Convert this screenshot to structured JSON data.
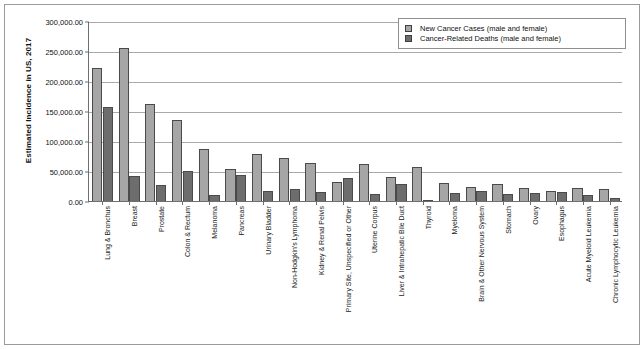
{
  "chart_data": {
    "type": "bar",
    "title": "",
    "xlabel": "",
    "ylabel": "Estimated Incidence in US, 2017",
    "ylim": [
      0,
      300000
    ],
    "ytick_labels": [
      "300,000.00",
      "250,000.00",
      "200,000.00",
      "150,000.00",
      "100,000.00",
      "50,000.00",
      "0.00"
    ],
    "ytick_values": [
      300000,
      250000,
      200000,
      150000,
      100000,
      50000,
      0
    ],
    "grid": true,
    "legend_position": "top-right",
    "categories": [
      "Lung & Bronchus",
      "Breast",
      "Prostate",
      "Colon & Rectum",
      "Melanoma",
      "Pancreas",
      "Urinary Bladder",
      "Non-Hodgkin's Lymphoma",
      "Kidney & Renal Pelvis",
      "Primary Site, Unspecified or Other",
      "Uterine Corpus",
      "Liver & Intrahepatic Bile Duct",
      "Thyroid",
      "Myeloma",
      "Brain & Other Nervous System",
      "Stomach",
      "Ovary",
      "Esophagus",
      "Acute Myeloid Leukemia",
      "Chronic Lymphocytic Leukemia"
    ],
    "series": [
      {
        "name": "New Cancer Cases (male and female)",
        "color": "#a6a6a6",
        "values": [
          222500,
          255000,
          161400,
          135400,
          87100,
          53700,
          79000,
          72200,
          63900,
          32000,
          61400,
          40700,
          56800,
          30300,
          23800,
          28000,
          22400,
          16900,
          21400,
          20100
        ]
      },
      {
        "name": "Cancer-Related Deaths (male and female)",
        "color": "#6d6d6d",
        "values": [
          155900,
          41100,
          26700,
          50300,
          9700,
          43000,
          16900,
          20100,
          14400,
          38000,
          10900,
          28900,
          2000,
          12600,
          16700,
          10900,
          14100,
          15700,
          10600,
          4700
        ]
      }
    ]
  },
  "legend": {
    "items": [
      {
        "label": "New Cancer Cases (male and female)"
      },
      {
        "label": "Cancer-Related Deaths (male and female)"
      }
    ]
  }
}
